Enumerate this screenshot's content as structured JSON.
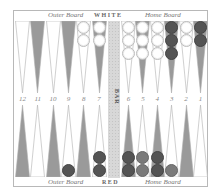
{
  "labels": {
    "top_left": "Outer Board",
    "top_center": "WHITE",
    "top_right": "Home Board",
    "bottom_left": "Outer Board",
    "bottom_center": "RED",
    "bottom_right": "Home Board",
    "bar": "BAR"
  },
  "point_numbers": {
    "left": [
      "12",
      "11",
      "10",
      "9",
      "8",
      "7"
    ],
    "right": [
      "6",
      "5",
      "4",
      "3",
      "2",
      "1"
    ]
  },
  "colors": {
    "light_point": "#ffffff",
    "dark_point": "#9a9a9a",
    "white_checker": "#ffffff",
    "dark_checker": "#545454",
    "red_checker": "#7a7a7a"
  },
  "top_points": [
    {
      "shade": "light",
      "checkers": []
    },
    {
      "shade": "dark",
      "checkers": []
    },
    {
      "shade": "light",
      "checkers": []
    },
    {
      "shade": "dark",
      "checkers": []
    },
    {
      "shade": "light",
      "checkers": [
        "white",
        "white"
      ]
    },
    {
      "shade": "dark",
      "checkers": [
        "white",
        "white"
      ]
    },
    {
      "shade": "light",
      "checkers": [
        "white",
        "white",
        "white"
      ]
    },
    {
      "shade": "dark",
      "checkers": [
        "white",
        "white",
        "white"
      ]
    },
    {
      "shade": "light",
      "checkers": [
        "white",
        "white",
        "white"
      ]
    },
    {
      "shade": "dark",
      "checkers": [
        "dark",
        "dark",
        "dark"
      ]
    },
    {
      "shade": "light",
      "checkers": [
        "white",
        "white"
      ]
    },
    {
      "shade": "dark",
      "checkers": [
        "dark",
        "dark"
      ]
    }
  ],
  "bottom_points": [
    {
      "shade": "dark",
      "checkers": []
    },
    {
      "shade": "light",
      "checkers": []
    },
    {
      "shade": "dark",
      "checkers": []
    },
    {
      "shade": "light",
      "checkers": [
        "dark"
      ]
    },
    {
      "shade": "dark",
      "checkers": []
    },
    {
      "shade": "light",
      "checkers": [
        "dark",
        "dark"
      ]
    },
    {
      "shade": "dark",
      "checkers": [
        "dark",
        "dark"
      ]
    },
    {
      "shade": "light",
      "checkers": [
        "red",
        "red"
      ]
    },
    {
      "shade": "dark",
      "checkers": [
        "dark",
        "dark"
      ]
    },
    {
      "shade": "light",
      "checkers": [
        "red"
      ]
    },
    {
      "shade": "dark",
      "checkers": []
    },
    {
      "shade": "light",
      "checkers": []
    }
  ]
}
